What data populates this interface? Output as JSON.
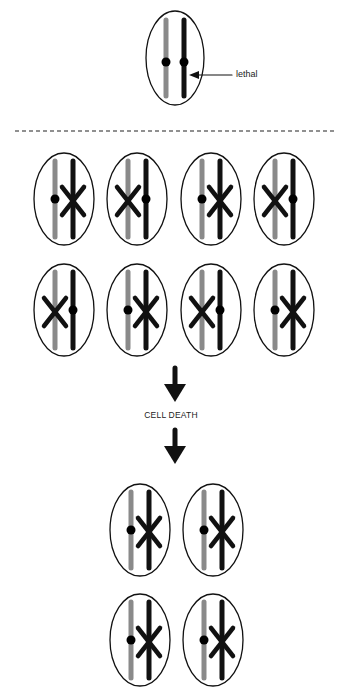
{
  "labels": {
    "lethal": "lethal",
    "cell_death": "CELL DEATH"
  },
  "colors": {
    "background": "#ffffff",
    "outline": "#111111",
    "chromosome_grey": "#8a8a8a",
    "chromosome_black": "#111111",
    "centromere": "#000000"
  },
  "diagram": {
    "top_cell": {
      "cx": 175,
      "cy": 58,
      "type": "parental",
      "annotation": "lethal"
    },
    "divider": {
      "y": 131,
      "style": "dashed"
    },
    "rows": [
      {
        "cy": 199,
        "cells": [
          {
            "cx": 64,
            "type": "A"
          },
          {
            "cx": 137,
            "type": "B"
          },
          {
            "cx": 211,
            "type": "A"
          },
          {
            "cx": 284,
            "type": "B"
          }
        ]
      },
      {
        "cy": 310,
        "cells": [
          {
            "cx": 64,
            "type": "B"
          },
          {
            "cx": 137,
            "type": "A"
          },
          {
            "cx": 211,
            "type": "B"
          },
          {
            "cx": 284,
            "type": "A"
          }
        ]
      },
      {
        "cy": 530,
        "cells": [
          {
            "cx": 140,
            "type": "A"
          },
          {
            "cx": 213,
            "type": "A"
          }
        ]
      },
      {
        "cy": 640,
        "cells": [
          {
            "cx": 140,
            "type": "A"
          },
          {
            "cx": 213,
            "type": "A"
          }
        ]
      }
    ],
    "arrows": [
      {
        "cx": 175,
        "y1": 368,
        "y2": 402
      },
      {
        "cx": 175,
        "y1": 430,
        "y2": 464
      }
    ]
  }
}
